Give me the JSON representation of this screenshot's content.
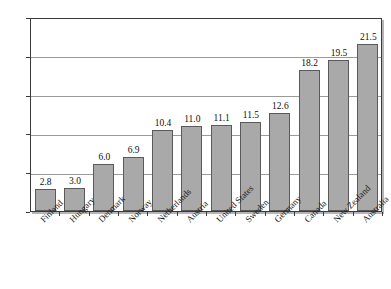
{
  "chart_data": {
    "type": "bar",
    "title": "",
    "subtitle": "",
    "xlabel": "",
    "ylabel": "",
    "ylim": [
      0,
      25
    ],
    "y_ticks": [
      0,
      5,
      10,
      15,
      20,
      25
    ],
    "grid": true,
    "legend": null,
    "legend_position": "none",
    "orientation": "vertical",
    "value_labels": true,
    "categories": [
      "Finland",
      "Hungary",
      "Denmark",
      "Norway",
      "Netherlands",
      "Austria",
      "United States",
      "Sweden",
      "Germany",
      "Canada",
      "New Zealand",
      "Australia"
    ],
    "values": [
      2.8,
      3.0,
      6.0,
      6.9,
      10.4,
      11.0,
      11.1,
      11.5,
      12.6,
      18.2,
      19.5,
      21.5
    ],
    "value_label_texts": [
      "2.8",
      "3.0",
      "6.0",
      "6.9",
      "10.4",
      "11.0",
      "11.1",
      "11.5",
      "12.6",
      "18.2",
      "19.5",
      "21.5"
    ],
    "y_tick_labels": [
      "0",
      "5",
      "10",
      "15",
      "20",
      "25"
    ],
    "colors": {
      "bar_fill": "#a9a9a9",
      "bar_stroke": "#5a5a5a",
      "gridline": "#9a9a9a",
      "axis": "#3a3a3a",
      "background": "#ffffff",
      "text": "#1a1a1a"
    }
  },
  "caption": {
    "text": ""
  }
}
